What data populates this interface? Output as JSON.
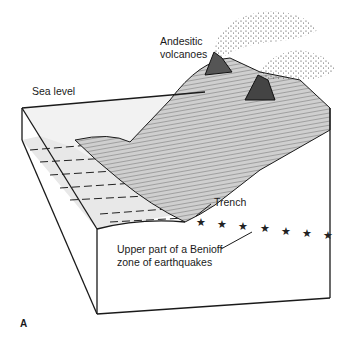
{
  "figure": {
    "type": "block diagram",
    "panel_label": "A",
    "labels": {
      "volcanoes_line1": "Andesitic",
      "volcanoes_line2": "volcanoes",
      "sea_level": "Sea level",
      "trench": "Trench",
      "benioff_line1": "Upper part of a Benioff",
      "benioff_line2": "zone of earthquakes"
    },
    "earthquake_markers": {
      "symbol": "star",
      "count": 7
    },
    "colors": {
      "line": "#1a1a1a",
      "sea_fill": "#e6e6e6",
      "land_fill": "#bdbdbd",
      "background": "#ffffff"
    }
  }
}
